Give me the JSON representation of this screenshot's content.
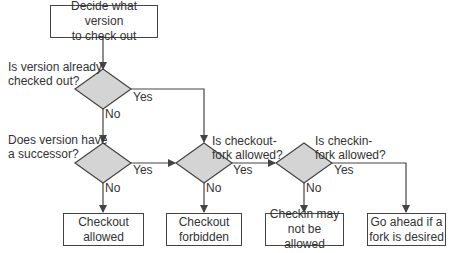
{
  "start": {
    "line1": "Decide what version",
    "line2": "to check out"
  },
  "decisions": [
    {
      "line1": "Is version already",
      "line2": "checked out?",
      "yes": "Yes",
      "no": "No"
    },
    {
      "line1": "Does version have",
      "line2": "a successor?",
      "yes": "Yes",
      "no": "No"
    },
    {
      "line1": "Is checkout-",
      "line2": "fork allowed?",
      "yes": "Yes",
      "no": "No"
    },
    {
      "line1": "Is checkin-",
      "line2": "fork allowed?",
      "yes": "Yes",
      "no": "No"
    }
  ],
  "outcomes": [
    {
      "line1": "Checkout",
      "line2": "allowed"
    },
    {
      "line1": "Checkout",
      "line2": "forbidden"
    },
    {
      "line1": "Checkin may",
      "line2": "not be allowed"
    },
    {
      "line1": "Go ahead if a",
      "line2": "fork is desired"
    }
  ],
  "colors": {
    "diamond_fill": "#d4d4d4",
    "line": "#444444"
  }
}
